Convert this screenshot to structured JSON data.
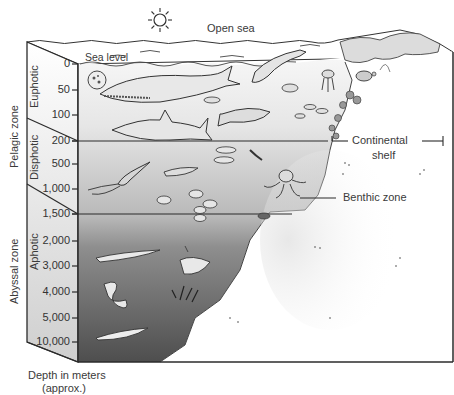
{
  "title_labels": {
    "open_sea": "Open sea",
    "sea_level": "Sea level"
  },
  "zones": {
    "pelagic": "Pelagic zone",
    "abyssal": "Abyssal zone",
    "euphotic": "Euphotic",
    "disphotic": "Disphotic",
    "aphotic": "Aphotic"
  },
  "callouts": {
    "continental_shelf_line1": "Continental",
    "continental_shelf_line2": "shelf",
    "benthic_zone": "Benthic zone"
  },
  "depth_scale": {
    "ticks": [
      "0",
      "50",
      "100",
      "200",
      "500",
      "1,000",
      "1,500",
      "2,000",
      "3,000",
      "4,000",
      "5,000",
      "10,000"
    ],
    "caption_line1": "Depth in meters",
    "caption_line2": "(approx.)"
  },
  "icons": {
    "sun": "sun-icon",
    "organisms": [
      "plankton",
      "whale",
      "dolphin",
      "shark",
      "tuna",
      "small-fish",
      "jellyfish",
      "sea-turtle",
      "coral",
      "squid",
      "shrimp",
      "octopus",
      "crab",
      "eel",
      "anglerfish",
      "gulper-eel",
      "deep-sea-fish",
      "tube-worms"
    ]
  },
  "colors": {
    "euphotic_water": "#f2f2f2",
    "disphotic_water": "#cfcfcf",
    "aphotic_water_top": "#8a8a8a",
    "aphotic_water_bottom": "#5a5a5a",
    "seafloor": "#ffffff",
    "outline": "#2b2b2b"
  }
}
